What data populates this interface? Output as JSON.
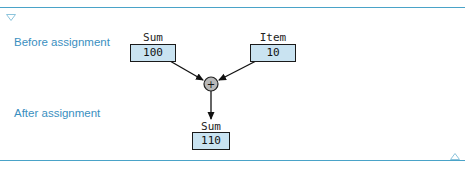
{
  "labels": {
    "before": "Before assignment",
    "after": "After assignment"
  },
  "before": {
    "sum": {
      "name": "Sum",
      "value": "100"
    },
    "item": {
      "name": "Item",
      "value": "10"
    }
  },
  "operator": {
    "symbol": "+"
  },
  "after": {
    "sum": {
      "name": "Sum",
      "value": "110"
    }
  },
  "colors": {
    "rule": "#4aa3c8",
    "label": "#3a8fbf",
    "box_fill": "#c9e3f1",
    "operator_fill": "#b8b8b8"
  },
  "icons": {
    "top": "collapse-triangle-down-icon",
    "bottom": "collapse-triangle-up-icon"
  }
}
